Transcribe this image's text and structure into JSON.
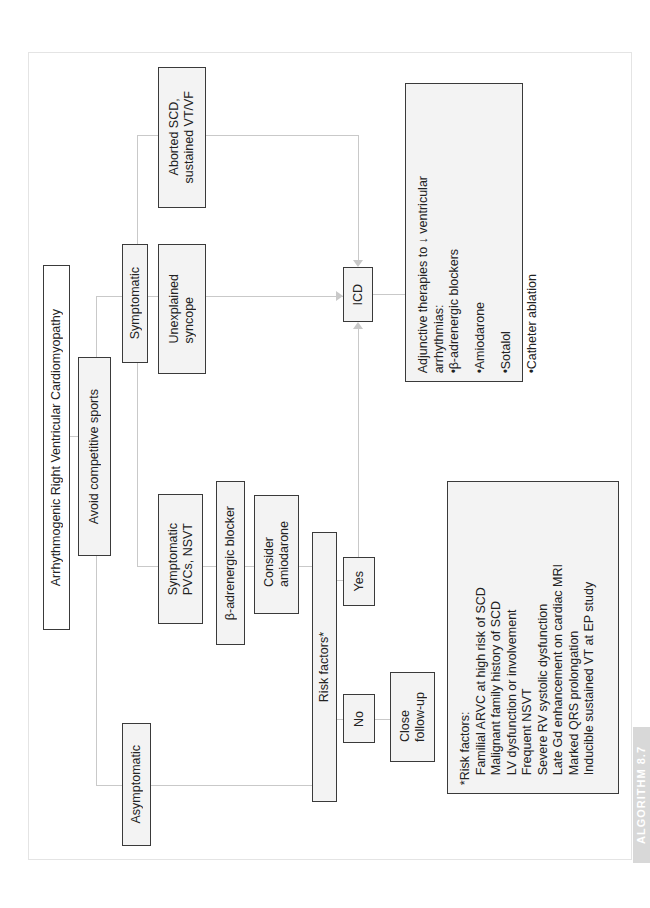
{
  "diagram": {
    "title": "Arrhythmogenic Right Ventricular Cardiomyopathy",
    "avoid": "Avoid competitive sports",
    "symptomatic": "Symptomatic",
    "asymptomatic": "Asymptomatic",
    "aborted_scd": [
      "Aborted SCD,",
      "sustained VT/VF"
    ],
    "unexplained_syncope": [
      "Unexplained",
      "syncope"
    ],
    "symptomatic_pvcs": [
      "Symptomatic",
      "PVCs, NSVT"
    ],
    "beta_blocker": "β-adrenergic blocker",
    "consider_amiodarone": [
      "Consider",
      "amiodarone"
    ],
    "risk_factors_decision": "Risk factors*",
    "yes": "Yes",
    "no": "No",
    "close_followup": [
      "Close",
      "follow-up"
    ],
    "icd": "ICD",
    "adjunctive": {
      "heading_line1": "Adjunctive therapies to ↓ ventricular",
      "heading_line2": "arrhythmias:",
      "items": [
        "β-adrenergic blockers",
        "Amiodarone",
        "Sotalol",
        "Catheter ablation"
      ],
      "bullet": "•"
    },
    "risk_legend": {
      "heading": "*Risk factors:",
      "items": [
        "Familial ARVC at high risk of SCD",
        "Malignant family history of SCD",
        "LV dysfunction or involvement",
        "Frequent NSVT",
        "Severe RV systolic dysfunction",
        "Late Gd enhancement on cardiac MRI",
        "Marked QRS prolongation",
        "Inducible sustained VT at EP study"
      ]
    },
    "tag": "ALGORITHM 8.7"
  },
  "colors": {
    "box_fill": "#f3f3f3",
    "box_border": "#3a3a3a",
    "connector": "#c9c9c9",
    "tag_bg": "#d8d8d8"
  }
}
